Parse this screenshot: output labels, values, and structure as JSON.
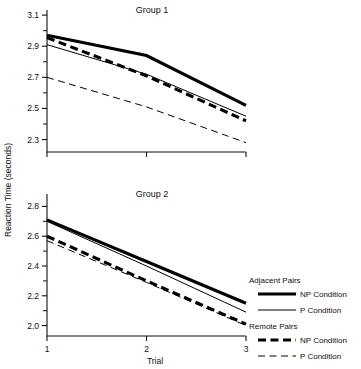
{
  "chart_data": {
    "type": "line",
    "title": "",
    "xlabel": "Trial",
    "ylabel": "Reaction Time (seconds)",
    "x": [
      1,
      2,
      3
    ],
    "xticklabels": [
      "1",
      "2",
      "3"
    ],
    "grid": false,
    "legend_position": "right-bottom",
    "panels": [
      {
        "title": "Group 1",
        "ylim": [
          2.22,
          3.12
        ],
        "yticks": [
          2.3,
          2.5,
          2.7,
          2.9,
          3.1
        ],
        "yticklabels": [
          "2.3",
          "2.5",
          "2.7",
          "2.9",
          "3.1"
        ],
        "yminor": [
          2.4,
          2.6,
          2.8,
          3.0
        ],
        "series": [
          {
            "name": "Adjacent Pairs NP Condition",
            "style": "adj-np",
            "values": [
              2.97,
              2.84,
              2.52
            ]
          },
          {
            "name": "Adjacent Pairs P Condition",
            "style": "adj-p",
            "values": [
              2.91,
              2.72,
              2.45
            ]
          },
          {
            "name": "Remote Pairs NP Condition",
            "style": "rem-np",
            "values": [
              2.955,
              2.71,
              2.42
            ]
          },
          {
            "name": "Remote Pairs P Condition",
            "style": "rem-p",
            "values": [
              2.7,
              2.51,
              2.28
            ]
          }
        ]
      },
      {
        "title": "Group 2",
        "ylim": [
          1.93,
          2.87
        ],
        "yticks": [
          2.0,
          2.2,
          2.4,
          2.6,
          2.8
        ],
        "yticklabels": [
          "2.0",
          "2.2",
          "2.4",
          "2.6",
          "2.8"
        ],
        "yminor": [
          2.1,
          2.3,
          2.5,
          2.7
        ],
        "series": [
          {
            "name": "Adjacent Pairs NP Condition",
            "style": "adj-np",
            "values": [
              2.71,
              2.43,
              2.15
            ]
          },
          {
            "name": "Adjacent Pairs P Condition",
            "style": "adj-p",
            "values": [
              2.7,
              2.4,
              2.09
            ]
          },
          {
            "name": "Remote Pairs NP Condition",
            "style": "rem-np",
            "values": [
              2.6,
              2.3,
              2.01
            ]
          },
          {
            "name": "Remote Pairs P Condition",
            "style": "rem-p",
            "values": [
              2.57,
              2.29,
              2.0
            ]
          }
        ]
      }
    ],
    "legend": {
      "groups": [
        {
          "heading": "Adjacent Pairs",
          "entries": [
            {
              "label": "NP Condition",
              "style": "adj-np"
            },
            {
              "label": "P   Condition",
              "style": "adj-p"
            }
          ]
        },
        {
          "heading": "Remote Pairs",
          "entries": [
            {
              "label": "NP Condition",
              "style": "rem-np"
            },
            {
              "label": "P   Condition",
              "style": "rem-p"
            }
          ]
        }
      ]
    }
  }
}
